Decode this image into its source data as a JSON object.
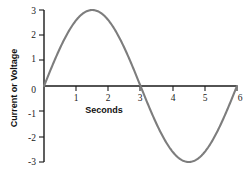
{
  "chart_data": {
    "type": "line",
    "title": "",
    "subtitle": "",
    "xlabel": "Seconds",
    "ylabel": "Current or Voltage",
    "xlim": [
      0,
      6
    ],
    "ylim": [
      -3,
      3
    ],
    "xticks": [
      "1",
      "2",
      "3",
      "4",
      "5",
      "6"
    ],
    "xtick_values": [
      1,
      2,
      3,
      4,
      5,
      6
    ],
    "yticks": [
      "3",
      "2",
      "1",
      "0",
      "-1",
      "-2",
      "-3"
    ],
    "ytick_values": [
      3,
      2,
      1,
      0,
      -1,
      -2,
      -3
    ],
    "grid": false,
    "legend": null,
    "annotations": [],
    "series": [
      {
        "name": "sine wave",
        "color": "#7d7d7d",
        "equation": "y = 3 sin(2 pi x / 6)",
        "amplitude": 3,
        "period": 6,
        "x": [
          0,
          0.25,
          0.5,
          0.75,
          1,
          1.25,
          1.5,
          1.75,
          2,
          2.25,
          2.5,
          2.75,
          3,
          3.25,
          3.5,
          3.75,
          4,
          4.25,
          4.5,
          4.75,
          5,
          5.25,
          5.5,
          5.75,
          6
        ],
        "values": [
          0,
          0.78,
          1.5,
          2.12,
          2.6,
          2.9,
          3,
          2.9,
          2.6,
          2.12,
          1.5,
          0.78,
          0,
          -0.78,
          -1.5,
          -2.12,
          -2.6,
          -2.9,
          -3,
          -2.9,
          -2.6,
          -2.12,
          -1.5,
          -0.78,
          0
        ]
      }
    ],
    "colors": {
      "curve": "#7d7d7d",
      "axis": "#1a1a1a",
      "text": "#111111",
      "background": "#ffffff"
    }
  }
}
